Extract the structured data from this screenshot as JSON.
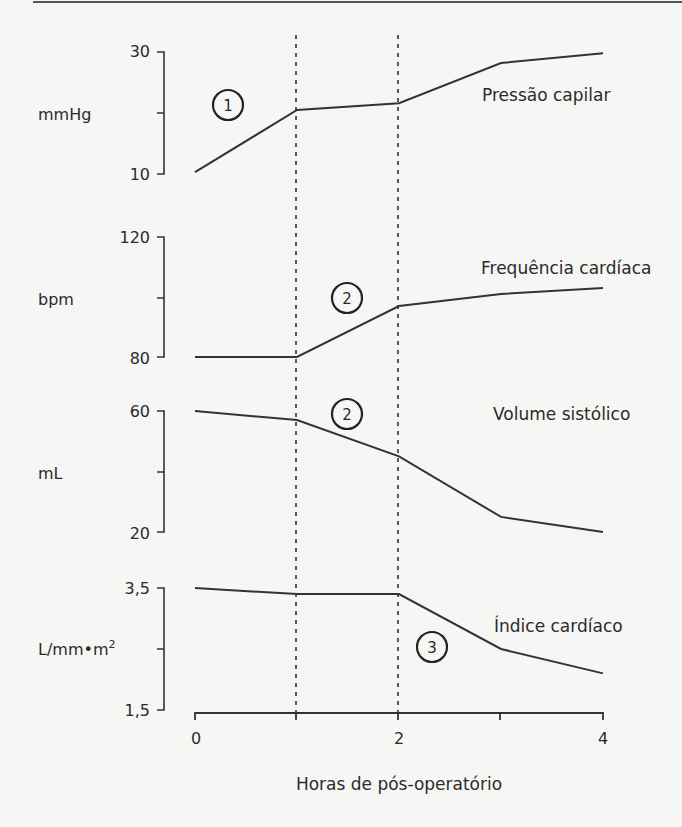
{
  "chart_data": {
    "type": "line",
    "title": "",
    "xlabel": "Horas de pós-operatório",
    "x": [
      0,
      1,
      2,
      3,
      4
    ],
    "x_tick_labels": [
      "0",
      "",
      "2",
      "",
      "4"
    ],
    "xlim": [
      0,
      4
    ],
    "vertical_reference_lines_x": [
      1,
      2
    ],
    "panels": [
      {
        "name": "Pressão capilar",
        "ylabel": "mmHg",
        "ylim": [
          10,
          30
        ],
        "y_tick_labels": [
          "30",
          "10"
        ],
        "values": [
          10.3,
          20.5,
          21.6,
          28.2,
          29.8
        ],
        "annotation": "1",
        "annotation_x": 0.6
      },
      {
        "name": "Frequência cardíaca",
        "ylabel": "bpm",
        "ylim": [
          80,
          120
        ],
        "y_tick_labels": [
          "120",
          "80"
        ],
        "values": [
          80,
          80,
          97,
          101,
          103
        ],
        "annotation": "2",
        "annotation_x": 1.6
      },
      {
        "name": "Volume sistólico",
        "ylabel": "mL",
        "ylim": [
          20,
          60
        ],
        "y_tick_labels": [
          "60",
          "20"
        ],
        "values": [
          60,
          57,
          45,
          25,
          20
        ],
        "annotation": "2",
        "annotation_x": 1.6
      },
      {
        "name": "Índice cardíaco",
        "ylabel": "L/mm•m²",
        "ylim": [
          1.5,
          3.5
        ],
        "y_tick_labels": [
          "3,5",
          "1,5"
        ],
        "values": [
          3.5,
          3.4,
          3.4,
          2.5,
          2.1
        ],
        "annotation": "3",
        "annotation_x": 2.35
      }
    ],
    "grid": false,
    "legend": "none (series labeled inline)"
  },
  "labels": {
    "p1_name": "Pressão capilar",
    "p1_unit": "mmHg",
    "p1_ymax": "30",
    "p1_ymin": "10",
    "p1_badge": "1",
    "p2_name": "Frequência cardíaca",
    "p2_unit": "bpm",
    "p2_ymax": "120",
    "p2_ymin": "80",
    "p2_badge": "2",
    "p3_name": "Volume sistólico",
    "p3_unit": "mL",
    "p3_ymax": "60",
    "p3_ymin": "20",
    "p3_badge": "2",
    "p4_name": "Índice cardíaco",
    "p4_unit": "L/mm•m",
    "p4_unit_sup": "2",
    "p4_ymax": "3,5",
    "p4_ymin": "1,5",
    "p4_badge": "3",
    "x0": "0",
    "x2": "2",
    "x4": "4",
    "xlabel": "Horas de pós-operatório"
  }
}
